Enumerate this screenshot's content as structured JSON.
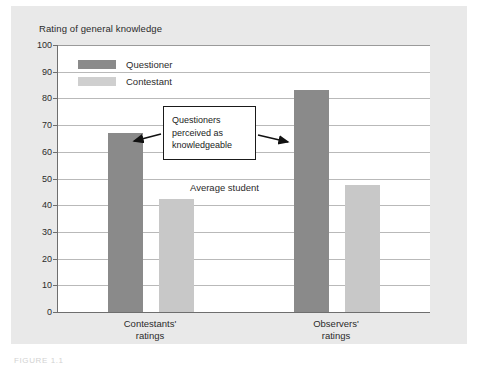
{
  "chart_data": {
    "type": "bar",
    "title": "Rating of general knowledge",
    "xlabel": "",
    "ylabel": "Rating of general knowledge",
    "ylim": [
      0,
      100
    ],
    "ytick_step": 10,
    "yticks": [
      "100",
      "90",
      "80",
      "70",
      "60",
      "50",
      "40",
      "30",
      "20",
      "10",
      "0"
    ],
    "grid": true,
    "legend_position": "inside-top-left",
    "categories": [
      "Contestants'\nratings",
      "Observers'\nratings"
    ],
    "series": [
      {
        "name": "Questioner",
        "color": "#8a8a8a",
        "values": [
          67,
          83
        ]
      },
      {
        "name": "Contestant",
        "color": "#c8c8c8",
        "values": [
          42.5,
          47.5
        ]
      }
    ],
    "annotations": [
      {
        "name": "callout",
        "text": "Questioners\nperceived as\nknowledgeable"
      },
      {
        "name": "average-student",
        "text": "Average student"
      }
    ]
  },
  "legend": {
    "items": [
      {
        "label": "Questioner",
        "swatch": "#8a8a8a"
      },
      {
        "label": "Contestant",
        "swatch": "#cfcfcf"
      }
    ]
  },
  "axis": {
    "title": "Rating of general knowledge",
    "ticks": [
      "100",
      "90",
      "80",
      "70",
      "60",
      "50",
      "40",
      "30",
      "20",
      "10",
      "0"
    ]
  },
  "categories": [
    {
      "label": "Contestants'\nratings"
    },
    {
      "label": "Observers'\nratings"
    }
  ],
  "callout": {
    "text": "Questioners\nperceived as\nknowledgeable"
  },
  "notes": {
    "average_student": "Average student"
  },
  "caption": {
    "text": "FIGURE 1.1"
  },
  "colors": {
    "questioner": "#8a8a8a",
    "contestant": "#c8c8c8",
    "panel": "#e9e9e9",
    "plot": "#ffffff",
    "gridline": "#b9b9b9",
    "axis": "#6e6e6e",
    "text": "#2b2b2b"
  }
}
